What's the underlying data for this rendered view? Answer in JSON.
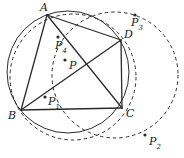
{
  "figure": {
    "type": "geometry-diagram",
    "width": 184,
    "height": 158,
    "stroke_color": "#2b2b2b",
    "label_color": "#1a1a1a",
    "background": "#ffffff"
  },
  "vertices": [
    {
      "id": "A",
      "label": "A",
      "x": 47,
      "y": 15,
      "label_x": 40,
      "label_y": 2
    },
    {
      "id": "B",
      "label": "B",
      "x": 21,
      "y": 110,
      "label_x": 8,
      "label_y": 110
    },
    {
      "id": "C",
      "label": "C",
      "x": 122,
      "y": 108,
      "label_x": 126,
      "label_y": 108
    },
    {
      "id": "D",
      "label": "D",
      "x": 121,
      "y": 40,
      "label_x": 124,
      "label_y": 29
    }
  ],
  "points": [
    {
      "id": "P",
      "label": "P",
      "sub": "",
      "x": 65,
      "y": 60,
      "label_x": 69,
      "label_y": 60
    },
    {
      "id": "P1",
      "label": "P",
      "sub": "1",
      "x": 45,
      "y": 97,
      "label_x": 48,
      "label_y": 96
    },
    {
      "id": "P2",
      "label": "P",
      "sub": "2",
      "x": 145,
      "y": 135,
      "label_x": 149,
      "label_y": 136
    },
    {
      "id": "P3",
      "label": "P",
      "sub": "3",
      "x": 135,
      "y": 15,
      "label_x": 131,
      "label_y": 17
    },
    {
      "id": "P4",
      "label": "P",
      "sub": "4",
      "x": 58,
      "y": 37,
      "label_x": 55,
      "label_y": 40
    }
  ],
  "segments": [
    {
      "name": "side-A-B",
      "from": "A",
      "to": "B",
      "style": "solid"
    },
    {
      "name": "side-B-C",
      "from": "B",
      "to": "C",
      "style": "solid"
    },
    {
      "name": "side-C-D",
      "from": "C",
      "to": "D",
      "style": "solid"
    },
    {
      "name": "side-D-A",
      "from": "D",
      "to": "A",
      "style": "solid"
    },
    {
      "name": "diagonal-A-C",
      "from": "A",
      "to": "C",
      "style": "solid"
    },
    {
      "name": "diagonal-B-D",
      "from": "B",
      "to": "D",
      "style": "solid"
    }
  ],
  "circles": [
    {
      "name": "circumcircle",
      "cx": 68,
      "cy": 72,
      "r": 61,
      "style": "solid"
    },
    {
      "name": "dashed-circle-small",
      "cx": 73,
      "cy": 77,
      "r": 63,
      "style": "dashed"
    },
    {
      "name": "dashed-circle-large",
      "cx": 115,
      "cy": 75,
      "r": 63,
      "style": "dashed"
    }
  ]
}
